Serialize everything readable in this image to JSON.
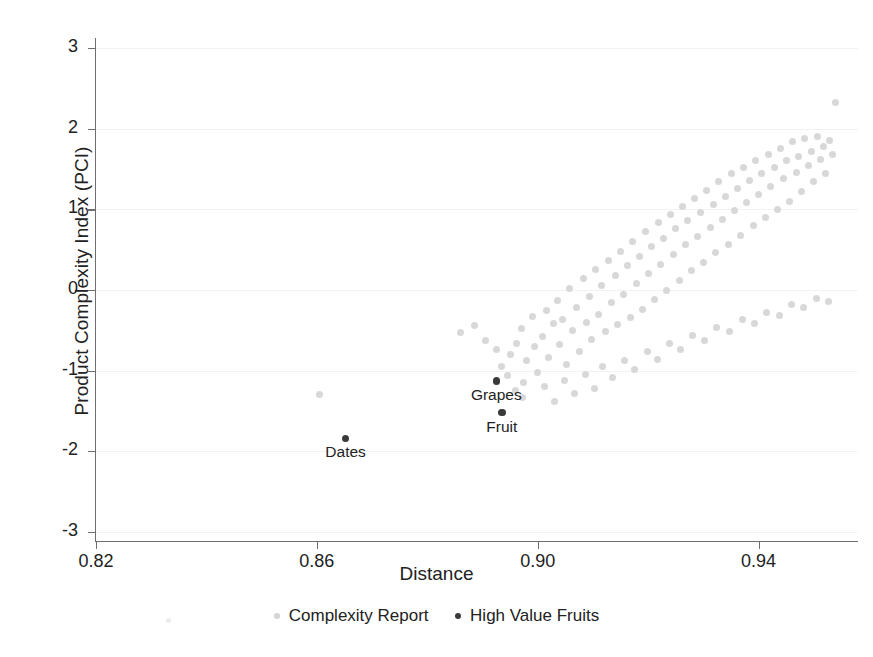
{
  "chart_data": {
    "type": "scatter",
    "title": "",
    "xlabel": "Distance",
    "ylabel": "Product Complexity Index (PCI)",
    "xlim": [
      0.82,
      0.958
    ],
    "ylim": [
      -3.1,
      3.1
    ],
    "xticks": [
      0.82,
      0.86,
      0.9,
      0.94
    ],
    "xtick_labels": [
      "0.82",
      "0.86",
      "0.90",
      "0.94"
    ],
    "yticks": [
      3,
      2,
      1,
      0,
      -1,
      -2,
      -3
    ],
    "ytick_labels": [
      "3",
      "2",
      "1",
      "0",
      "-1",
      "-2",
      "-3"
    ],
    "grid": "faint horizontal gridlines",
    "legend_position": "bottom-center",
    "colors": {
      "complexity_report": "#d8d8d8",
      "high_value_fruits": "#3a3a3a",
      "axis": "#6e6e6e",
      "text": "#222222",
      "background": "#ffffff"
    },
    "series": [
      {
        "name": "Complexity Report",
        "marker": "circle",
        "color": "#d8d8d8",
        "points": [
          [
            0.8605,
            -1.29
          ],
          [
            0.886,
            -0.53
          ],
          [
            0.8885,
            -0.44
          ],
          [
            0.8905,
            -0.62
          ],
          [
            0.8925,
            -0.74
          ],
          [
            0.8935,
            -0.95
          ],
          [
            0.8945,
            -1.06
          ],
          [
            0.895,
            -0.8
          ],
          [
            0.8962,
            -0.66
          ],
          [
            0.897,
            -0.48
          ],
          [
            0.8975,
            -1.15
          ],
          [
            0.898,
            -0.88
          ],
          [
            0.899,
            -0.33
          ],
          [
            0.8995,
            -0.7
          ],
          [
            0.9,
            -1.02
          ],
          [
            0.9008,
            -0.58
          ],
          [
            0.9015,
            -0.25
          ],
          [
            0.902,
            -0.84
          ],
          [
            0.9028,
            -0.41
          ],
          [
            0.9035,
            -0.13
          ],
          [
            0.904,
            -0.68
          ],
          [
            0.9045,
            -0.36
          ],
          [
            0.9052,
            -0.92
          ],
          [
            0.9058,
            0.02
          ],
          [
            0.9063,
            -0.5
          ],
          [
            0.907,
            -0.22
          ],
          [
            0.9075,
            -0.76
          ],
          [
            0.9082,
            0.14
          ],
          [
            0.9088,
            -0.4
          ],
          [
            0.9093,
            -0.08
          ],
          [
            0.9098,
            -0.61
          ],
          [
            0.9105,
            0.26
          ],
          [
            0.911,
            -0.3
          ],
          [
            0.9115,
            0.05
          ],
          [
            0.9122,
            -0.52
          ],
          [
            0.9128,
            0.36
          ],
          [
            0.9133,
            -0.16
          ],
          [
            0.914,
            0.18
          ],
          [
            0.9145,
            -0.43
          ],
          [
            0.915,
            0.48
          ],
          [
            0.9156,
            -0.05
          ],
          [
            0.9162,
            0.3
          ],
          [
            0.9168,
            -0.34
          ],
          [
            0.9172,
            0.6
          ],
          [
            0.9178,
            0.08
          ],
          [
            0.9184,
            0.42
          ],
          [
            0.919,
            -0.24
          ],
          [
            0.9195,
            0.72
          ],
          [
            0.92,
            0.2
          ],
          [
            0.9206,
            0.54
          ],
          [
            0.9212,
            -0.12
          ],
          [
            0.9218,
            0.84
          ],
          [
            0.9222,
            0.32
          ],
          [
            0.9228,
            0.64
          ],
          [
            0.9234,
            0.0
          ],
          [
            0.924,
            0.94
          ],
          [
            0.9245,
            0.44
          ],
          [
            0.925,
            0.76
          ],
          [
            0.9256,
            0.12
          ],
          [
            0.9262,
            1.04
          ],
          [
            0.9268,
            0.56
          ],
          [
            0.9272,
            0.86
          ],
          [
            0.9278,
            0.24
          ],
          [
            0.9284,
            1.14
          ],
          [
            0.929,
            0.66
          ],
          [
            0.9295,
            0.96
          ],
          [
            0.93,
            0.34
          ],
          [
            0.9306,
            1.24
          ],
          [
            0.9312,
            0.78
          ],
          [
            0.9318,
            1.06
          ],
          [
            0.9322,
            0.46
          ],
          [
            0.9328,
            1.34
          ],
          [
            0.9334,
            0.88
          ],
          [
            0.934,
            1.16
          ],
          [
            0.9345,
            0.56
          ],
          [
            0.935,
            1.44
          ],
          [
            0.9356,
            0.98
          ],
          [
            0.9362,
            1.26
          ],
          [
            0.9368,
            0.68
          ],
          [
            0.9372,
            1.52
          ],
          [
            0.9378,
            1.08
          ],
          [
            0.9384,
            1.36
          ],
          [
            0.939,
            0.8
          ],
          [
            0.9395,
            1.6
          ],
          [
            0.94,
            1.18
          ],
          [
            0.9406,
            1.44
          ],
          [
            0.9412,
            0.9
          ],
          [
            0.9418,
            1.68
          ],
          [
            0.9422,
            1.28
          ],
          [
            0.9428,
            1.52
          ],
          [
            0.9434,
            1.0
          ],
          [
            0.944,
            1.76
          ],
          [
            0.9445,
            1.38
          ],
          [
            0.945,
            1.6
          ],
          [
            0.9456,
            1.1
          ],
          [
            0.9462,
            1.84
          ],
          [
            0.9468,
            1.46
          ],
          [
            0.9472,
            1.66
          ],
          [
            0.9478,
            1.22
          ],
          [
            0.9484,
            1.88
          ],
          [
            0.949,
            1.54
          ],
          [
            0.9495,
            1.72
          ],
          [
            0.95,
            1.34
          ],
          [
            0.9506,
            1.9
          ],
          [
            0.9512,
            1.62
          ],
          [
            0.9518,
            1.78
          ],
          [
            0.9522,
            1.44
          ],
          [
            0.9528,
            1.86
          ],
          [
            0.9534,
            1.68
          ],
          [
            0.954,
            2.33
          ],
          [
            0.896,
            -1.25
          ],
          [
            0.8972,
            -1.33
          ],
          [
            0.9012,
            -1.2
          ],
          [
            0.903,
            -1.38
          ],
          [
            0.9048,
            -1.12
          ],
          [
            0.9066,
            -1.28
          ],
          [
            0.9086,
            -1.05
          ],
          [
            0.9102,
            -1.22
          ],
          [
            0.9118,
            -0.95
          ],
          [
            0.9136,
            -1.08
          ],
          [
            0.9158,
            -0.88
          ],
          [
            0.9176,
            -0.98
          ],
          [
            0.9198,
            -0.76
          ],
          [
            0.9216,
            -0.86
          ],
          [
            0.9238,
            -0.66
          ],
          [
            0.9258,
            -0.74
          ],
          [
            0.928,
            -0.56
          ],
          [
            0.9302,
            -0.62
          ],
          [
            0.9324,
            -0.46
          ],
          [
            0.9348,
            -0.52
          ],
          [
            0.937,
            -0.36
          ],
          [
            0.9392,
            -0.42
          ],
          [
            0.9414,
            -0.28
          ],
          [
            0.9438,
            -0.32
          ],
          [
            0.946,
            -0.18
          ],
          [
            0.9482,
            -0.22
          ],
          [
            0.9504,
            -0.1
          ],
          [
            0.9526,
            -0.14
          ]
        ]
      },
      {
        "name": "High Value Fruits",
        "marker": "circle",
        "color": "#3a3a3a",
        "points": [
          [
            0.8925,
            -1.13
          ],
          [
            0.8935,
            -1.52
          ],
          [
            0.8652,
            -1.84
          ]
        ],
        "labels": [
          "Grapes",
          "Fruit",
          "Dates"
        ]
      }
    ]
  },
  "axis": {
    "y_title": "Product Complexity Index (PCI)",
    "x_title": "Distance"
  },
  "legend": {
    "entries": [
      {
        "label": "Complexity Report",
        "marker": "light-gray-dot"
      },
      {
        "label": "High Value Fruits",
        "marker": "dark-dot"
      }
    ]
  },
  "annotations": [
    {
      "text": "Grapes"
    },
    {
      "text": "Fruit"
    },
    {
      "text": "Dates"
    }
  ]
}
